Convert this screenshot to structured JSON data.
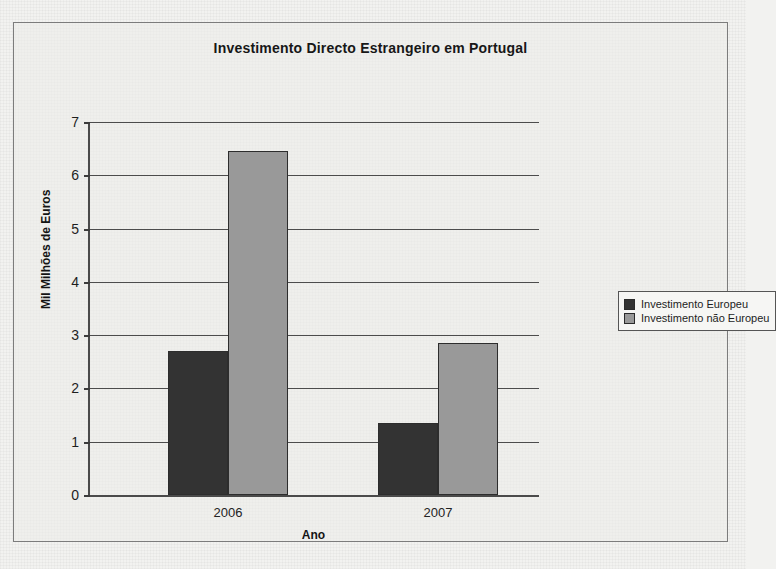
{
  "chart_data": {
    "type": "bar",
    "title": "Investimento Directo Estrangeiro em Portugal",
    "xlabel": "Ano",
    "ylabel": "Mil Milhões de Euros",
    "categories": [
      "2006",
      "2007"
    ],
    "series": [
      {
        "name": "Investimento Europeu",
        "values": [
          2.7,
          1.35
        ],
        "color": "#333333"
      },
      {
        "name": "Investimento não Europeu",
        "values": [
          6.45,
          2.85
        ],
        "color": "#999999"
      }
    ],
    "ylim": [
      0,
      7
    ],
    "yticks": [
      0,
      1,
      2,
      3,
      4,
      5,
      6,
      7
    ],
    "ytick_labels": [
      "0",
      "1",
      "2",
      "3",
      "4",
      "5",
      "6",
      "7"
    ],
    "gridlines": true,
    "legend_position": "right"
  },
  "legend": {
    "entries": [
      {
        "label": "Investimento Europeu",
        "swatch": "#333333"
      },
      {
        "label": "Investimento não Europeu",
        "swatch": "#999999"
      }
    ]
  }
}
